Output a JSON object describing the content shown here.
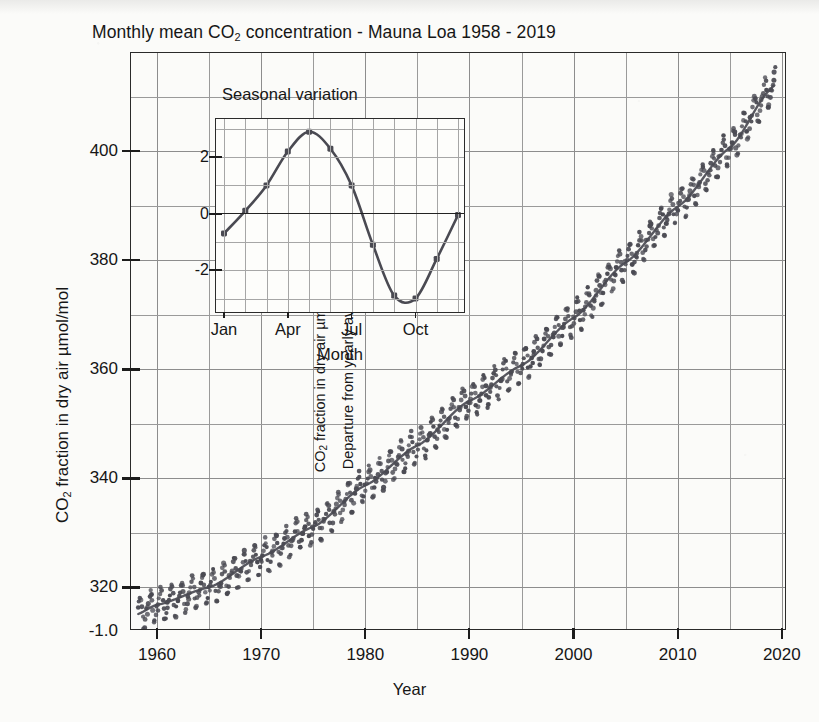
{
  "figure": {
    "title_pre": "Monthly mean CO",
    "title_sub": "2",
    "title_post": " concentration - Mauna Loa 1958 - 2019",
    "ylabel_pre": "CO",
    "ylabel_sub": "2",
    "ylabel_post": " fraction in dry air µmol/mol",
    "xlabel": "Year",
    "extra_y_label": "-1.0",
    "ink_color": "#4a4a52",
    "grid_color": "#9a9a9a",
    "frame_color": "#2a2a2a",
    "background": "#fbfbf9"
  },
  "chart_data": {
    "type": "scatter",
    "title": "Monthly mean CO2 concentration - Mauna Loa 1958 - 2019",
    "xlabel": "Year",
    "ylabel": "CO2 fraction in dry air µmol/mol",
    "grid": true,
    "legend": null,
    "xlim": [
      1957.5,
      2020.5
    ],
    "ylim": [
      312,
      418
    ],
    "xticks": [
      1960,
      1970,
      1980,
      1990,
      2000,
      2010,
      2020
    ],
    "xtick_labels": [
      "1960",
      "1970",
      "1980",
      "1990",
      "2000",
      "2010",
      "2020"
    ],
    "x_minor_step": 5,
    "yticks": [
      320,
      340,
      360,
      380,
      400
    ],
    "ytick_labels": [
      "320",
      "340",
      "360",
      "380",
      "400"
    ],
    "y_minor_step": 10,
    "series_description": "Monthly mean CO2 with annual sawtooth oscillation (amplitude ~3 umol/mol) superimposed on a rising trend; a smooth trend line runs through the points.",
    "seasonal_amplitude": 3.0,
    "trend": {
      "x": [
        1958,
        1960,
        1965,
        1970,
        1975,
        1980,
        1985,
        1990,
        1995,
        2000,
        2005,
        2010,
        2015,
        2019
      ],
      "y": [
        315.0,
        316.8,
        320.0,
        325.6,
        331.1,
        338.7,
        346.0,
        354.2,
        360.7,
        369.4,
        379.6,
        389.8,
        400.6,
        411.5
      ]
    }
  },
  "inset": {
    "title": "Seasonal variation",
    "ylabel_line1_pre": "CO",
    "ylabel_line1_sub": "2",
    "ylabel_line1_post": " fraction in dry air µmol/mol",
    "ylabel_line2": "Departure from yearly average",
    "xlabel": "Month",
    "chart_data": {
      "type": "line",
      "title": "Seasonal variation",
      "xlabel": "Month",
      "ylabel": "CO2 fraction in dry air µmol/mol / Departure from yearly average",
      "grid": true,
      "categories": [
        "Jan",
        "Feb",
        "Mar",
        "Apr",
        "May",
        "Jun",
        "Jul",
        "Aug",
        "Sep",
        "Oct",
        "Nov",
        "Dec"
      ],
      "values": [
        -0.7,
        0.1,
        1.0,
        2.2,
        2.9,
        2.3,
        1.0,
        -1.1,
        -2.9,
        -3.0,
        -1.6,
        -0.05
      ],
      "yticks": [
        2,
        0,
        -2
      ],
      "ytick_labels": [
        "2",
        "0",
        "-2"
      ],
      "xticks": [
        "Jan",
        "Apr",
        "Jul",
        "Oct"
      ],
      "ylim": [
        -3.55,
        3.35
      ],
      "markers": true
    }
  }
}
